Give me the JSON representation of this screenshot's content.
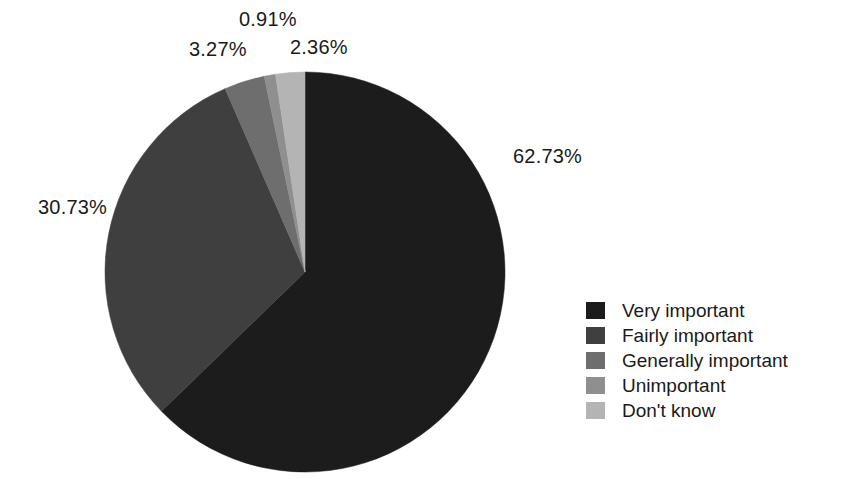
{
  "chart_data": {
    "type": "pie",
    "title": "",
    "subtitle": "",
    "xlabel": "",
    "ylabel": "",
    "grid": false,
    "legend_position": "right",
    "start_angle_deg": 0,
    "direction": "clockwise",
    "center": {
      "x": 305,
      "y": 272
    },
    "radius": 200,
    "categories": [
      "Very important",
      "Fairly important",
      "Generally important",
      "Unimportant",
      "Don't know"
    ],
    "values": [
      62.73,
      30.73,
      3.27,
      0.91,
      2.36
    ],
    "value_labels": [
      "62.73%",
      "30.73%",
      "3.27%",
      "0.91%",
      "2.36%"
    ],
    "colors": [
      "#1c1c1c",
      "#3f3f3f",
      "#6e6e6e",
      "#8f8f8f",
      "#b4b4b4"
    ],
    "slices": [
      {
        "label": "Very important",
        "value": 62.73,
        "display": "62.73%",
        "color": "#1c1c1c"
      },
      {
        "label": "Fairly important",
        "value": 30.73,
        "display": "30.73%",
        "color": "#3f3f3f"
      },
      {
        "label": "Generally important",
        "value": 3.27,
        "display": "3.27%",
        "color": "#6e6e6e"
      },
      {
        "label": "Unimportant",
        "value": 0.91,
        "display": "0.91%",
        "color": "#8f8f8f"
      },
      {
        "label": "Don't know",
        "value": 2.36,
        "display": "2.36%",
        "color": "#b4b4b4"
      }
    ]
  },
  "legend": {
    "items": [
      {
        "label": "Very important",
        "color": "#1c1c1c"
      },
      {
        "label": "Fairly important",
        "color": "#3f3f3f"
      },
      {
        "label": "Generally important",
        "color": "#6e6e6e"
      },
      {
        "label": "Unimportant",
        "color": "#8f8f8f"
      },
      {
        "label": "Don't know",
        "color": "#b4b4b4"
      }
    ]
  }
}
